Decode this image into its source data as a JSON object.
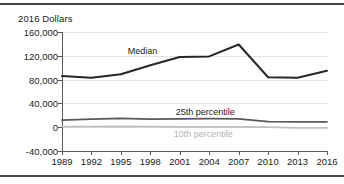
{
  "figure": {
    "axis_title": "2016 Dollars"
  },
  "chart_data": {
    "type": "line",
    "title": "",
    "subtitle": "",
    "xlabel": "",
    "ylabel": "2016 Dollars",
    "grid": true,
    "legend_position": "inline-annotations",
    "categories": [
      "1989",
      "1992",
      "1995",
      "1998",
      "2001",
      "2004",
      "2007",
      "2010",
      "2013",
      "2016"
    ],
    "x": [
      1989,
      1992,
      1995,
      1998,
      2001,
      2004,
      2007,
      2010,
      2013,
      2016
    ],
    "xlim": [
      1989,
      2016
    ],
    "ylim": [
      -40000,
      160000
    ],
    "yticks": [
      -40000,
      0,
      40000,
      80000,
      120000,
      160000
    ],
    "ytick_labels": [
      "-40,000",
      "0",
      "40,000",
      "80,000",
      "120,000",
      "160,000"
    ],
    "series": [
      {
        "name": "Median",
        "label": "Median",
        "color": "#262626",
        "width": 2.0,
        "values": [
          86000,
          83000,
          89000,
          104000,
          118000,
          119000,
          139000,
          84000,
          83000,
          95000
        ]
      },
      {
        "name": "25th percentile",
        "label": "25th percentile",
        "color": "#595959",
        "width": 1.8,
        "values": [
          12000,
          13500,
          15000,
          13500,
          14000,
          14500,
          14000,
          9500,
          9000,
          9000
        ]
      },
      {
        "name": "10th percentile",
        "label": "10th percentile",
        "color": "#bfbfbf",
        "width": 1.8,
        "values": [
          1000,
          1000,
          1200,
          800,
          700,
          600,
          500,
          0,
          -1000,
          -1200
        ]
      }
    ],
    "annotations": [
      {
        "text": "Median",
        "x": 1997.2,
        "y": 128000,
        "color": "#1a1a1a"
      },
      {
        "text": "25th percentile",
        "x": 2003.6,
        "y": 26000,
        "color": "#1a1a1a"
      },
      {
        "text": "10th percentile",
        "x": 2003.4,
        "y": -11000,
        "color": "#b4b4b4"
      }
    ]
  }
}
